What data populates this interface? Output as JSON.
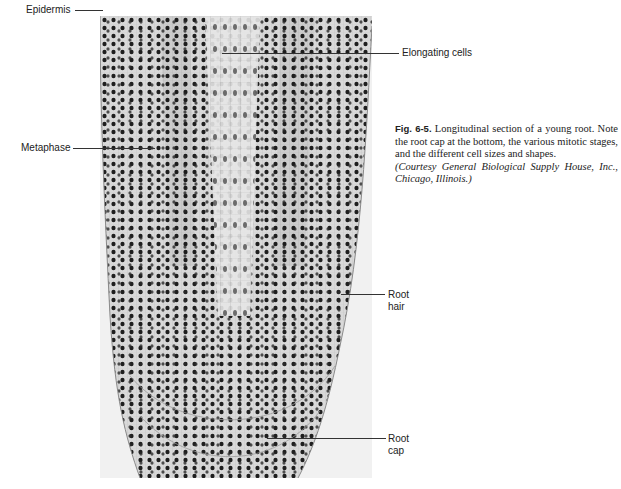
{
  "figure": {
    "number": "Fig. 6-5.",
    "caption": " Longitudinal section of a young root. Note the root cap at the bottom, the various mitotic stages, and the different cell sizes and shapes.",
    "credit": "(Courtesy General Biological Supply House, Inc., Chicago, Illinois.)"
  },
  "micrograph": {
    "subject": "Longitudinal section of young root tip",
    "background_color": "#f1f1f1",
    "tissue_color": "#dcdcdc",
    "nucleus_color": "#1e1e1e"
  },
  "labels": {
    "epidermis": "Epidermis",
    "elongating_cells": "Elongating cells",
    "metaphase": "Metaphase",
    "root_hair_line1": "Root",
    "root_hair_line2": "hair",
    "root_cap_line1": "Root",
    "root_cap_line2": "cap"
  }
}
